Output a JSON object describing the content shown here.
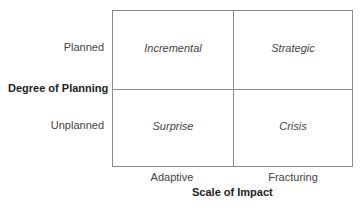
{
  "diagram": {
    "y_axis": {
      "title": "Degree of Planning",
      "labels": [
        "Planned",
        "Unplanned"
      ]
    },
    "x_axis": {
      "title": "Scale of Impact",
      "labels": [
        "Adaptive",
        "Fracturing"
      ]
    },
    "cells": {
      "top_left": "Incremental",
      "top_right": "Strategic",
      "bottom_left": "Surprise",
      "bottom_right": "Crisis"
    }
  }
}
